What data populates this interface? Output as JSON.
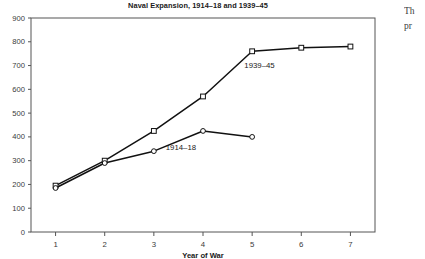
{
  "figure": {
    "title": "Naval Expansion, 1914–18 and 1939–45",
    "xlabel": "Year of War",
    "ylabel": "",
    "series_label_1": "1939–45",
    "series_label_2": "1914–18",
    "axis_color": "#555555",
    "line_color": "#111111",
    "marker_fill": "#ffffff"
  },
  "side_text": {
    "line1": "Th",
    "line2": "pr"
  },
  "chart_data": {
    "type": "line",
    "title": "Naval Expansion, 1914–18 and 1939–45",
    "xlabel": "Year of War",
    "ylabel": "",
    "xlim": [
      0.5,
      7.5
    ],
    "ylim": [
      0,
      900
    ],
    "xticks": [
      1,
      2,
      3,
      4,
      5,
      6,
      7
    ],
    "xtick_labels": [
      "1",
      "2",
      "3",
      "4",
      "5",
      "6",
      "7"
    ],
    "yticks": [
      0,
      100,
      200,
      300,
      400,
      500,
      600,
      700,
      800,
      900
    ],
    "ytick_labels": [
      "0",
      "100",
      "200",
      "300",
      "400",
      "500",
      "600",
      "700",
      "800",
      "900"
    ],
    "grid": false,
    "legend": "inline-annotations",
    "x": [
      1,
      2,
      3,
      4,
      5,
      6,
      7
    ],
    "series": [
      {
        "name": "1939–45",
        "marker": "square-open",
        "values": [
          195,
          300,
          425,
          570,
          760,
          775,
          780
        ],
        "annotation": "1939–45",
        "annotation_x": 5.15,
        "annotation_y": 690
      },
      {
        "name": "1914–18",
        "marker": "circle-open",
        "values": [
          185,
          290,
          340,
          425,
          400,
          null,
          null
        ],
        "annotation": "1914–18",
        "annotation_x": 3.55,
        "annotation_y": 345
      }
    ]
  }
}
